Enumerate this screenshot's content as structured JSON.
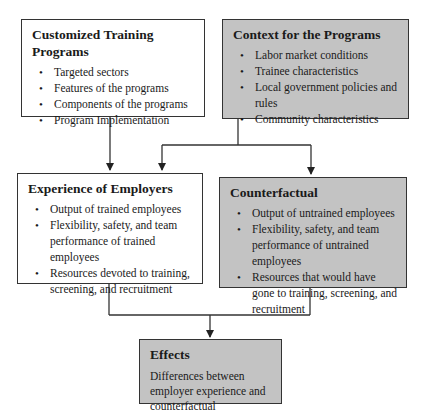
{
  "diagram": {
    "boxes": {
      "training": {
        "title": "Customized Training Programs",
        "items": [
          "Targeted sectors",
          "Features of the programs",
          "Components of the programs",
          "Program Implementation"
        ],
        "fill": "#ffffff"
      },
      "context": {
        "title": "Context for the Programs",
        "items": [
          "Labor market conditions",
          "Trainee characteristics",
          "Local government policies and rules",
          "Community characteristics"
        ],
        "fill": "#c3c3c3"
      },
      "experience": {
        "title": "Experience of Employers",
        "items": [
          "Output of trained employees",
          "Flexibility, safety, and team performance of trained employees",
          "Resources devoted to training, screening, and recruitment"
        ],
        "fill": "#ffffff"
      },
      "counterfactual": {
        "title": "Counterfactual",
        "items": [
          "Output of untrained employees",
          "Flexibility, safety, and team performance of untrained employees",
          "Resources that would have gone to training, screening, and recruitment"
        ],
        "fill": "#c3c3c3"
      },
      "effects": {
        "title": "Effects",
        "text": "Differences between employer experience and counterfactual",
        "fill": "#c3c3c3"
      }
    },
    "edges": [
      {
        "from": "Customized Training Programs",
        "to": "Experience of Employers"
      },
      {
        "from": "Context for the Programs",
        "to": "Experience of Employers"
      },
      {
        "from": "Context for the Programs",
        "to": "Counterfactual"
      },
      {
        "from": "Experience of Employers",
        "to": "Effects"
      },
      {
        "from": "Counterfactual",
        "to": "Effects"
      }
    ]
  }
}
